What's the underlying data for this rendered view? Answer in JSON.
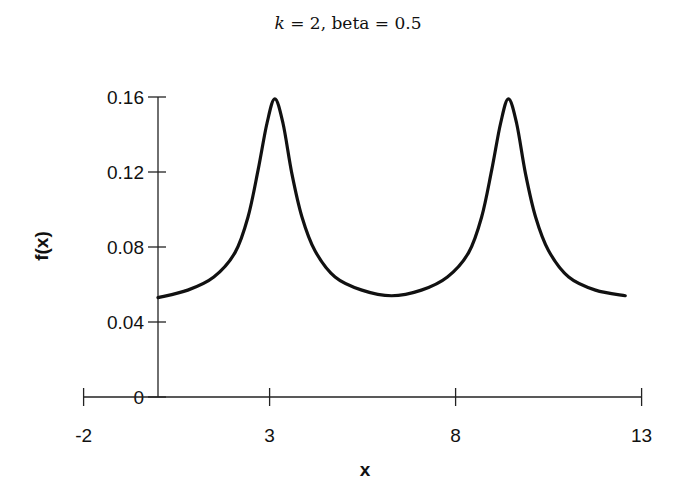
{
  "chart_data": {
    "type": "line",
    "title": "k = 2, beta = 0.5",
    "title_parts": {
      "k_symbol": "k",
      "rest": " = 2, beta = 0.5"
    },
    "xlabel": "x",
    "ylabel": "f(x)",
    "xlim": [
      -2,
      13
    ],
    "ylim": [
      0,
      0.16
    ],
    "x_ticks": [
      -2,
      3,
      8,
      13
    ],
    "x_tick_labels": [
      "-2",
      "3",
      "8",
      "13"
    ],
    "y_ticks": [
      0,
      0.04,
      0.08,
      0.12,
      0.16
    ],
    "y_tick_labels": [
      "0",
      "0.04",
      "0.08",
      "0.12",
      "0.16"
    ],
    "grid": false,
    "legend": null,
    "series": [
      {
        "name": "f(x)",
        "color": "#111111",
        "x": [
          0,
          0.8,
          1.5,
          2.07,
          2.42,
          2.69,
          2.93,
          3.14,
          3.36,
          3.6,
          3.87,
          4.22,
          4.76,
          5.48,
          6.28,
          7.08,
          7.78,
          8.35,
          8.7,
          8.97,
          9.21,
          9.42,
          9.64,
          9.88,
          10.15,
          10.5,
          11.04,
          11.76,
          12.56
        ],
        "y": [
          0.053,
          0.057,
          0.064,
          0.077,
          0.096,
          0.121,
          0.146,
          0.159,
          0.146,
          0.119,
          0.096,
          0.078,
          0.064,
          0.057,
          0.054,
          0.057,
          0.064,
          0.077,
          0.096,
          0.121,
          0.146,
          0.159,
          0.146,
          0.119,
          0.096,
          0.078,
          0.064,
          0.057,
          0.054
        ]
      }
    ]
  }
}
